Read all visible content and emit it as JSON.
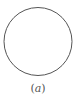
{
  "figure": {
    "shape": {
      "type": "circle",
      "cx": 38,
      "cy": 41.5,
      "r": 34,
      "stroke": "#555555",
      "stroke_width": 1,
      "fill": "#ffffff"
    },
    "caption": {
      "open": "(",
      "label": "a",
      "close": ")"
    }
  }
}
